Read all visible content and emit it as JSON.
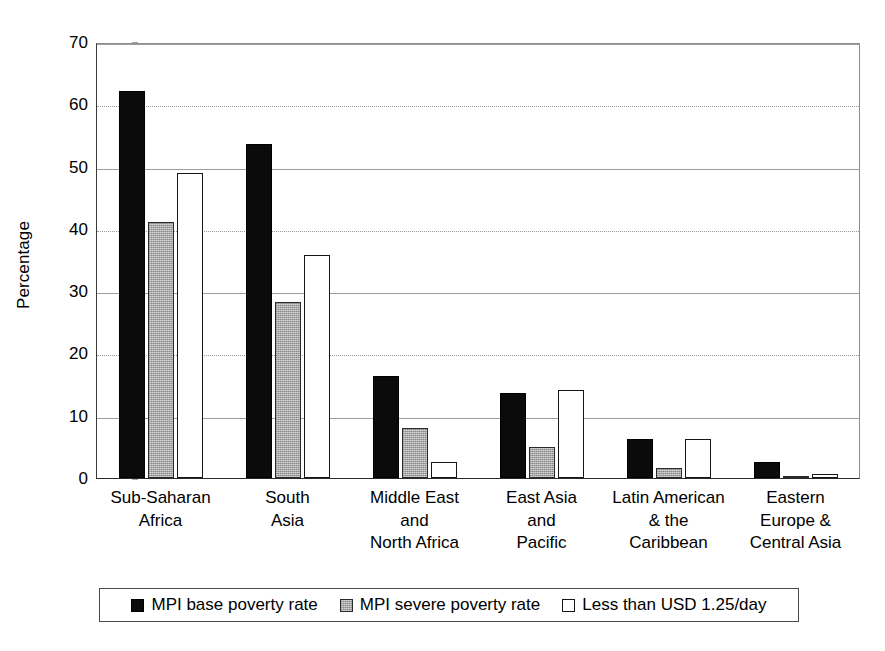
{
  "chart_data": {
    "type": "bar",
    "title": "",
    "xlabel": "",
    "ylabel": "Percentage",
    "ylim": [
      0,
      70
    ],
    "ytick_step": 10,
    "yticks": [
      70,
      60,
      50,
      40,
      30,
      20,
      10,
      0
    ],
    "grid": true,
    "legend_position": "bottom",
    "orientation": "vertical",
    "grouping": "grouped",
    "categories": [
      "Sub-Saharan Africa",
      "South Asia",
      "Middle East and North Africa",
      "East Asia and Pacific",
      "Latin American & the Caribbean",
      "Eastern Europe & Central Asia"
    ],
    "category_label_lines": [
      [
        "Sub-Saharan",
        "Africa"
      ],
      [
        "South",
        "Asia"
      ],
      [
        "Middle East",
        "and",
        "North Africa"
      ],
      [
        "East Asia",
        "and",
        "Pacific"
      ],
      [
        "Latin American",
        "& the",
        "Caribbean"
      ],
      [
        "Eastern",
        "Europe &",
        "Central Asia"
      ]
    ],
    "series": [
      {
        "name": "MPI base poverty rate",
        "color": "#0b0b0b",
        "style": "solid-black",
        "values": [
          62.2,
          53.7,
          16.3,
          13.6,
          6.3,
          2.5
        ]
      },
      {
        "name": "MPI severe poverty rate",
        "color": "#a8a8a8",
        "style": "gray-hatched",
        "values": [
          41.1,
          28.2,
          8.0,
          5.0,
          1.6,
          0.3
        ]
      },
      {
        "name": "Less than USD 1.25/day",
        "color": "#ffffff",
        "style": "white-outlined",
        "values": [
          48.9,
          35.8,
          2.6,
          14.2,
          6.3,
          0.6
        ]
      }
    ]
  },
  "legend": {
    "items": [
      {
        "label": "MPI base poverty rate",
        "swatch": "black-square-icon"
      },
      {
        "label": "MPI severe poverty rate",
        "swatch": "gray-square-icon"
      },
      {
        "label": "Less than USD 1.25/day",
        "swatch": "white-square-icon"
      }
    ]
  }
}
